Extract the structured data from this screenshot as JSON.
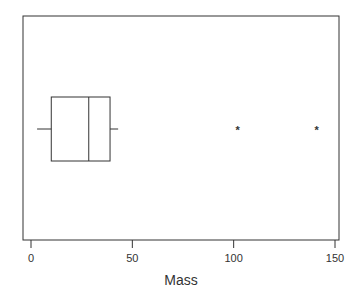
{
  "chart_data": {
    "type": "boxplot",
    "orientation": "horizontal",
    "title": "",
    "xlabel": "Mass",
    "ylabel": "",
    "xlim": [
      -4,
      152
    ],
    "xticks": [
      0,
      50,
      100,
      150
    ],
    "xtick_labels": [
      "0",
      "50",
      "100",
      "150"
    ],
    "grid": false,
    "series": [
      {
        "name": "Mass",
        "whisker_low": 3,
        "q1": 10,
        "median": 28.5,
        "q3": 39,
        "whisker_high": 43,
        "outliers": [
          102,
          141
        ]
      }
    ],
    "colors": {
      "line": "#333333",
      "background": "#ffffff"
    }
  }
}
